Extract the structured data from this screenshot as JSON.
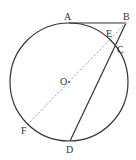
{
  "diagram": {
    "type": "geometry-circle",
    "circle": {
      "center_label": "O",
      "cx": 69,
      "cy": 82,
      "r": 59
    },
    "points": {
      "A": {
        "label": "A",
        "x": 69,
        "y": 23,
        "lx": 64,
        "ly": 20
      },
      "B": {
        "label": "B",
        "x": 126,
        "y": 23,
        "lx": 123,
        "ly": 20
      },
      "E": {
        "label": "E",
        "x": 112,
        "y": 40,
        "lx": 106,
        "ly": 36
      },
      "C": {
        "label": "C",
        "x": 116,
        "y": 49,
        "lx": 118,
        "ly": 52
      },
      "O": {
        "label": "O",
        "x": 69,
        "y": 82,
        "lx": 60,
        "ly": 85
      },
      "F": {
        "label": "F",
        "x": 28,
        "y": 124,
        "lx": 21,
        "ly": 134
      },
      "D": {
        "label": "D",
        "x": 70,
        "y": 141,
        "lx": 66,
        "ly": 153
      }
    },
    "segments": [
      {
        "from": "A",
        "to": "B",
        "style": "solid"
      },
      {
        "from": "B",
        "to": "D",
        "style": "solid"
      },
      {
        "from": "B",
        "to": "F",
        "style": "dashed"
      }
    ],
    "colors": {
      "stroke": "#333333",
      "dashed": "#9a9a9a"
    }
  }
}
